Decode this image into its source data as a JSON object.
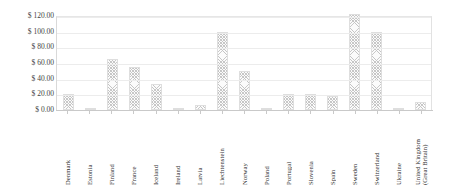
{
  "chart_data": {
    "type": "bar",
    "title": "",
    "subtitle": "",
    "xlabel": "",
    "ylabel": "",
    "ylim": [
      0,
      120
    ],
    "grid": true,
    "legend": false,
    "legend_position": "none",
    "y_tick_labels": [
      "$ 120.00",
      "$ 100.00",
      "$ 80.00",
      "$ 60.00",
      "$ 40.00",
      "$ 20.00",
      "$ 0.00"
    ],
    "y_tick_values": [
      120,
      100,
      80,
      60,
      40,
      20,
      0
    ],
    "categories": [
      "Denmark",
      "Estonia",
      "Finland",
      "France",
      "Iceland",
      "Ireland",
      "Latvia",
      "Liechtenstein",
      "Norway",
      "Poland",
      "Portugal",
      "Slovenia",
      "Spain",
      "Sweden",
      "Switzerland",
      "Ukraine",
      "United Kingdom\n(Great Britain)"
    ],
    "values": [
      20,
      1,
      65,
      55,
      33,
      2,
      7,
      100,
      50,
      1,
      20,
      20,
      18,
      122,
      100,
      0,
      10
    ],
    "bar_fill": "#fbfbfb",
    "bar_hatch": "crosshatch",
    "bar_border_color": "#dedede",
    "gridline_color": "#ececec",
    "axis_color": "#c9c9c9"
  }
}
